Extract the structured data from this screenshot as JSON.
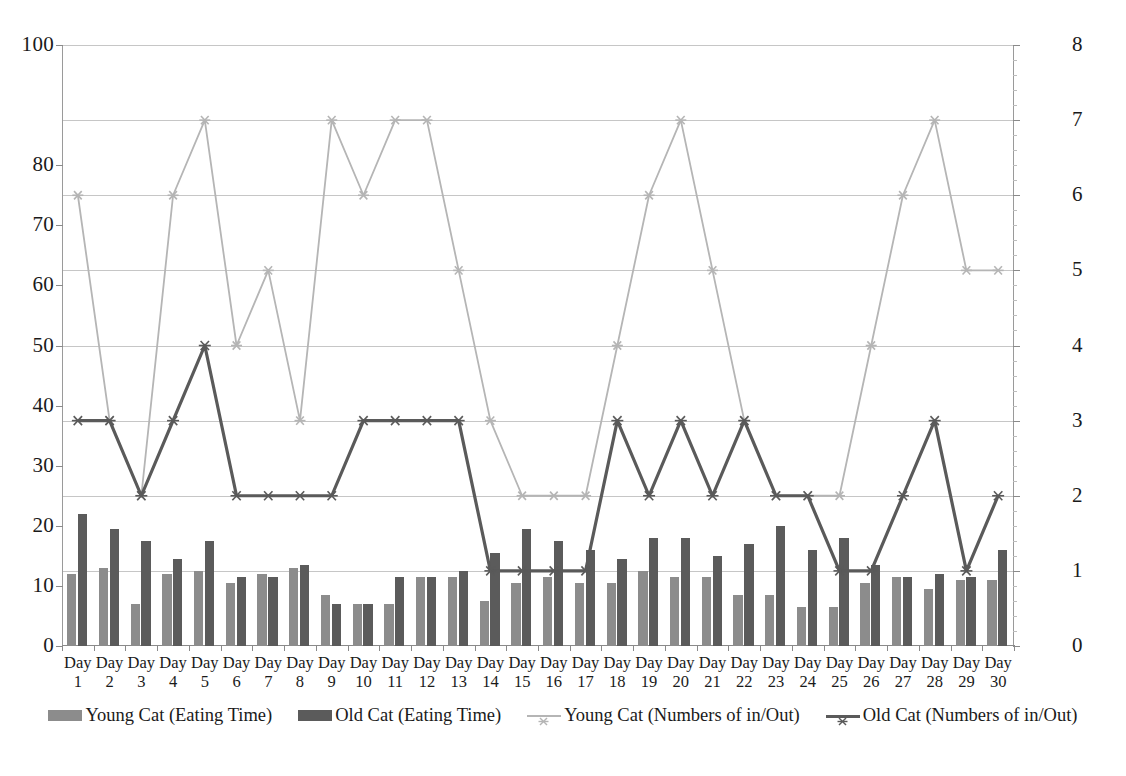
{
  "chart_data": {
    "type": "bar",
    "title": "",
    "subtitle": "",
    "xlabel": "",
    "ylabel": "",
    "y2label": "",
    "grid": true,
    "legend_position": "bottom",
    "categories": [
      "Day 1",
      "Day 2",
      "Day 3",
      "Day 4",
      "Day 5",
      "Day 6",
      "Day 7",
      "Day 8",
      "Day 9",
      "Day 10",
      "Day 11",
      "Day 12",
      "Day 13",
      "Day 14",
      "Day 15",
      "Day 16",
      "Day 17",
      "Day 18",
      "Day 19",
      "Day 20",
      "Day 21",
      "Day 22",
      "Day 23",
      "Day 24",
      "Day 25",
      "Day 26",
      "Day 27",
      "Day 28",
      "Day 29",
      "Day 30"
    ],
    "ylim": [
      0,
      100
    ],
    "y2lim": [
      0,
      8
    ],
    "yticks": [
      0,
      10,
      20,
      30,
      40,
      50,
      60,
      70,
      80,
      100
    ],
    "y2ticks": [
      0,
      1,
      2,
      3,
      4,
      5,
      6,
      7,
      8
    ],
    "series": [
      {
        "name": "Young Cat (Eating Time)",
        "type": "bar",
        "axis": "left",
        "color": "#8c8c8c",
        "values": [
          12,
          13,
          7,
          12,
          12.5,
          10.5,
          12,
          13,
          8.5,
          7,
          7,
          11.5,
          11.5,
          7.5,
          10.5,
          11.5,
          10.5,
          10.5,
          12.5,
          11.5,
          11.5,
          8.5,
          8.5,
          6.5,
          6.5,
          10.5,
          11.5,
          9.5,
          11,
          11
        ]
      },
      {
        "name": "Old Cat (Eating Time)",
        "type": "bar",
        "axis": "left",
        "color": "#5b5b5b",
        "values": [
          22,
          19.5,
          17.5,
          14.5,
          17.5,
          11.5,
          11.5,
          13.5,
          7,
          7,
          11.5,
          11.5,
          12.5,
          15.5,
          19.5,
          17.5,
          16,
          14.5,
          18,
          18,
          15,
          17,
          20,
          16,
          18,
          13.5,
          11.5,
          12,
          11.5,
          16
        ]
      },
      {
        "name": "Young Cat (Numbers of in/Out)",
        "type": "line",
        "axis": "right",
        "color": "#b5b5b5",
        "marker": "star",
        "values": [
          6,
          3,
          2,
          6,
          7,
          4,
          5,
          3,
          7,
          6,
          7,
          7,
          5,
          3,
          2,
          2,
          2,
          4,
          6,
          7,
          5,
          3,
          2,
          2,
          2,
          4,
          6,
          7,
          5,
          5
        ]
      },
      {
        "name": "Old Cat (Numbers of in/Out)",
        "type": "line",
        "axis": "right",
        "color": "#5a5a5a",
        "marker": "star",
        "values": [
          3,
          3,
          2,
          3,
          4,
          2,
          2,
          2,
          2,
          3,
          3,
          3,
          3,
          1,
          1,
          1,
          1,
          3,
          2,
          3,
          2,
          3,
          2,
          2,
          1,
          1,
          2,
          3,
          1,
          2
        ]
      }
    ]
  },
  "legend": {
    "items": [
      {
        "label": "Young Cat (Eating Time)",
        "kind": "bar",
        "color": "#8c8c8c"
      },
      {
        "label": "Old Cat (Eating Time)",
        "kind": "bar",
        "color": "#5b5b5b"
      },
      {
        "label": "Young Cat (Numbers of in/Out)",
        "kind": "line",
        "color": "#b5b5b5"
      },
      {
        "label": "Old Cat (Numbers of in/Out)",
        "kind": "line",
        "color": "#5a5a5a"
      }
    ]
  }
}
